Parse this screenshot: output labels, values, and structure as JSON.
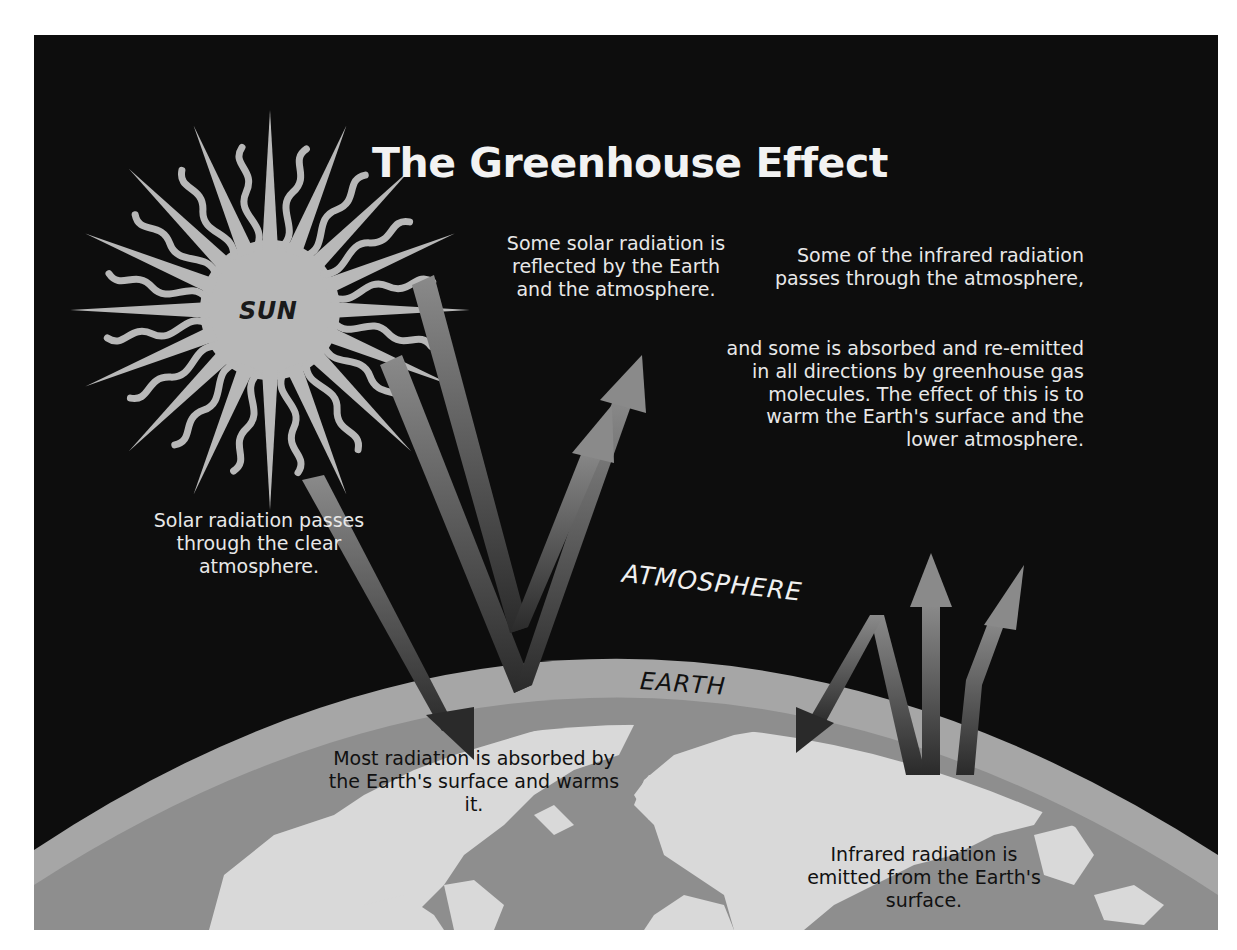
{
  "title": "The Greenhouse Effect",
  "labels": {
    "sun": "SUN",
    "atmosphere": "ATMOSPHERE",
    "earth": "EARTH"
  },
  "captions": {
    "solar_passes": "Solar radiation passes through the clear atmosphere.",
    "reflected": "Some solar radiation is reflected by the Earth and the atmosphere.",
    "ir_passes": "Some of the infrared radiation passes through the atmosphere,",
    "ir_absorbed": "and some is absorbed and re-emitted in all directions by greenhouse gas molecules. The effect of this is to warm the Earth's surface and the lower atmosphere.",
    "absorbed_surface": "Most radiation is absorbed by the Earth's surface and warms it.",
    "ir_emitted": "Infrared radiation is emitted from the Earth's surface."
  },
  "colors": {
    "background": "#0d0d0d",
    "sun": "#b8b8b8",
    "atmosphere_band": "#9a9a9a",
    "earth_ocean": "#8c8c8c",
    "earth_land": "#dcdcdc",
    "arrow_light": "#8a8a8a",
    "arrow_dark": "#2a2a2a"
  }
}
